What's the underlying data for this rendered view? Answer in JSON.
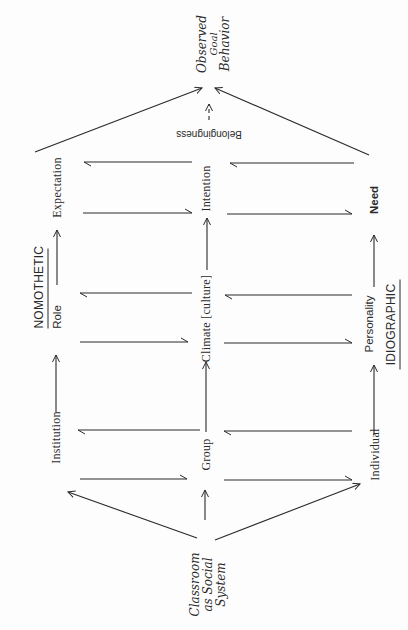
{
  "diagram": {
    "title_top": "NOMOTHETIC",
    "title_bottom": "IDIOGRAPHIC",
    "source_node": [
      "Classroom",
      "as Social",
      "System"
    ],
    "outcome_node": [
      "Observed",
      "Goal",
      "Behavior"
    ],
    "nomothetic_row": [
      "Institution",
      "Role",
      "Expectation"
    ],
    "middle_row": [
      "Group",
      "Climate [culture]",
      "Intention"
    ],
    "idiographic_row": [
      "Individual",
      "Personality",
      "Need"
    ],
    "belongingness": "Belongingness",
    "stroke_color": "#2a2a2a",
    "background_color": "#fdfdfd",
    "orientation": "rotated 90° counter-clockwise (flow runs bottom to top)"
  }
}
